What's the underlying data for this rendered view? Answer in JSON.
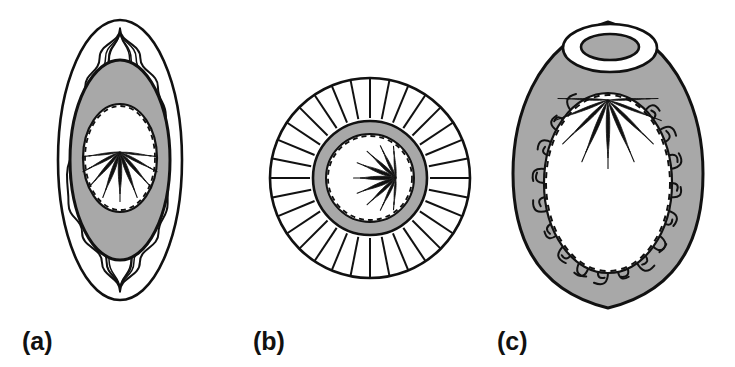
{
  "figure": {
    "kind": "scientific-line-diagram",
    "background_color": "#ffffff",
    "ink_color": "#111111",
    "gray_fill": "#a8a8a8",
    "white_fill": "#ffffff",
    "panel_count": 3,
    "panels": [
      {
        "id": "a",
        "label": "(a)",
        "label_x": 22,
        "label_y": 350,
        "description": "Oval structure with concentric wavy outer layers converging to points at top and bottom, a gray annular ring, and an inner dashed oval containing downward-fanning tapered spikes",
        "center_x": 120,
        "center_y": 160,
        "outer_rx": 62,
        "outer_ry": 140,
        "gray_ring_rx": 50,
        "gray_ring_ry": 100,
        "inner_dashed_rx": 35,
        "inner_dashed_ry": 52,
        "wavy_layer_count": 4,
        "apex_top_y": 28,
        "apex_bottom_y": 292,
        "spike_count": 9,
        "spike_direction": "downward-fan",
        "spike_origin_x": 120,
        "spike_origin_y": 152
      },
      {
        "id": "b",
        "label": "(b)",
        "label_x": 253,
        "label_y": 350,
        "description": "Circular structure with many radial spokes around a gray annular ring and an inner dashed circle containing leftward-fanning tapered spikes",
        "center_x": 370,
        "center_y": 178,
        "outer_r": 100,
        "spoke_inner_r": 60,
        "spoke_count": 32,
        "gray_ring_outer_r": 57,
        "gray_ring_inner_r": 43,
        "inner_dashed_r": 42,
        "spike_count": 9,
        "spike_direction": "leftward-fan",
        "spike_origin_x": 396,
        "spike_origin_y": 178
      },
      {
        "id": "c",
        "label": "(c)",
        "label_x": 497,
        "label_y": 350,
        "description": "Gray-filled ovoid body with a white elliptical ring opening at the top, an inner dashed oval fringed by curved hair-like cilia, and downward-fanning tapered spikes from the top",
        "center_x": 608,
        "center_y": 165,
        "outer_rx": 95,
        "outer_ry": 143,
        "cusp_top_y": 22,
        "cusp_bottom_y": 308,
        "ring_center_x": 610,
        "ring_center_y": 48,
        "ring_outer_rx": 47,
        "ring_outer_ry": 24,
        "ring_inner_rx": 29,
        "ring_inner_ry": 13,
        "inner_dashed_rx": 62,
        "inner_dashed_ry": 88,
        "inner_dashed_cx": 608,
        "inner_dashed_cy": 183,
        "cilia_count": 40,
        "spike_count": 9,
        "spike_direction": "downward-fan",
        "spike_origin_x": 608,
        "spike_origin_y": 100
      }
    ]
  }
}
